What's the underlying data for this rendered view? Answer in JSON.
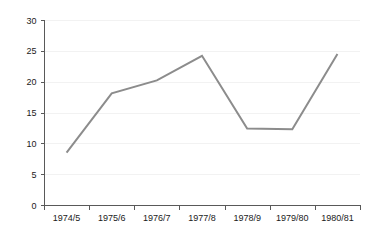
{
  "chart_data": {
    "type": "line",
    "title": "",
    "subtitle": "",
    "xlabel": "",
    "ylabel": "",
    "categories": [
      "1974/5",
      "1975/6",
      "1976/7",
      "1977/8",
      "1978/9",
      "1979/80",
      "1980/81"
    ],
    "series": [
      {
        "name": "",
        "values": [
          8.5,
          18.1,
          20.2,
          24.2,
          12.4,
          12.3,
          24.5
        ],
        "color": "#8c8c8c"
      }
    ],
    "ylim": [
      0,
      30
    ],
    "yticks": [
      0,
      5,
      10,
      15,
      20,
      25,
      30
    ],
    "ytick_labels": [
      "0",
      "5",
      "10",
      "15",
      "20",
      "25",
      "30"
    ],
    "grid": true,
    "grid_axis": "y",
    "grid_color": "#f2f2f2",
    "legend": false,
    "legend_position": "none",
    "axis_color": "#595959",
    "background_color": "#ffffff",
    "tick_label_color": "#1a1a1a"
  }
}
